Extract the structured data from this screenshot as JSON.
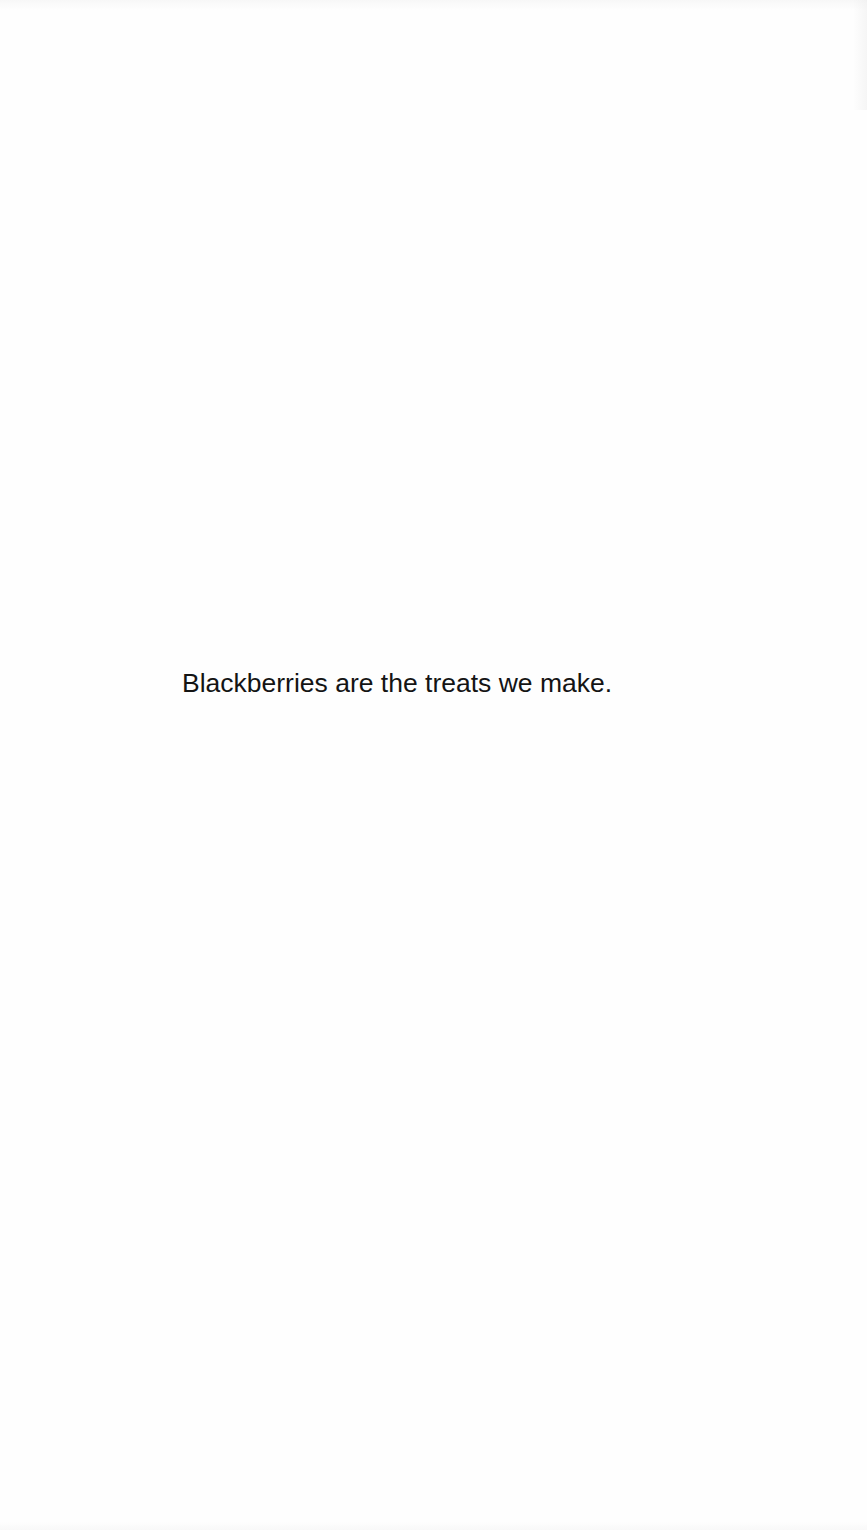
{
  "document": {
    "body_text": "Blackberries are the treats we make."
  },
  "colors": {
    "background": "#fefefe",
    "text": "#141414"
  }
}
